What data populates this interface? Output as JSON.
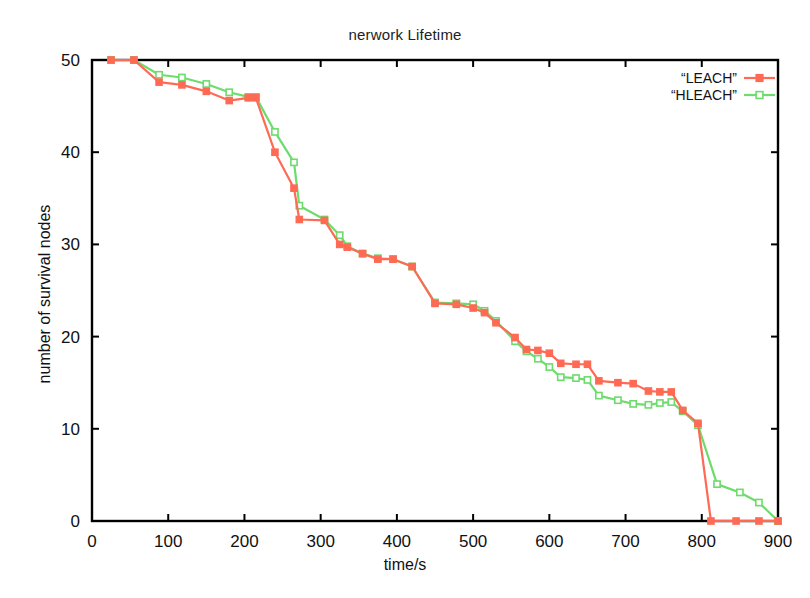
{
  "chart_data": {
    "type": "line",
    "title": "nerwork Lifetime",
    "xlabel": "time/s",
    "ylabel": "number of survival nodes",
    "xlim": [
      0,
      900
    ],
    "ylim": [
      0,
      50
    ],
    "xticks": [
      0,
      100,
      200,
      300,
      400,
      500,
      600,
      700,
      800,
      900
    ],
    "yticks": [
      0,
      10,
      20,
      30,
      40,
      50
    ],
    "grid": false,
    "legend_position": "top-right",
    "series": [
      {
        "name": "“LEACH”",
        "color": "#ff6a55",
        "marker": "filled-square",
        "points": [
          [
            25,
            50
          ],
          [
            55,
            50
          ],
          [
            88,
            47.6
          ],
          [
            118,
            47.3
          ],
          [
            150,
            46.6
          ],
          [
            180,
            45.6
          ],
          [
            205,
            45.9
          ],
          [
            215,
            45.9
          ],
          [
            240,
            40
          ],
          [
            265,
            36.1
          ],
          [
            272,
            32.7
          ],
          [
            305,
            32.6
          ],
          [
            325,
            30
          ],
          [
            335,
            29.7
          ],
          [
            355,
            29
          ],
          [
            375,
            28.4
          ],
          [
            395,
            28.4
          ],
          [
            420,
            27.6
          ],
          [
            450,
            23.6
          ],
          [
            478,
            23.5
          ],
          [
            500,
            23.1
          ],
          [
            515,
            22.6
          ],
          [
            530,
            21.5
          ],
          [
            555,
            19.9
          ],
          [
            570,
            18.6
          ],
          [
            585,
            18.5
          ],
          [
            600,
            18.2
          ],
          [
            615,
            17.1
          ],
          [
            635,
            17
          ],
          [
            650,
            17
          ],
          [
            665,
            15.2
          ],
          [
            690,
            15
          ],
          [
            710,
            14.9
          ],
          [
            730,
            14.1
          ],
          [
            745,
            14
          ],
          [
            760,
            14
          ],
          [
            775,
            12
          ],
          [
            795,
            10.6
          ],
          [
            812,
            0
          ],
          [
            845,
            0
          ],
          [
            875,
            0
          ],
          [
            900,
            0
          ]
        ]
      },
      {
        "name": "“HLEACH”",
        "color": "#6ddc6d",
        "marker": "open-square",
        "points": [
          [
            25,
            50
          ],
          [
            55,
            50
          ],
          [
            88,
            48.4
          ],
          [
            118,
            48.1
          ],
          [
            150,
            47.4
          ],
          [
            180,
            46.5
          ],
          [
            205,
            46
          ],
          [
            215,
            46
          ],
          [
            240,
            42.2
          ],
          [
            265,
            38.9
          ],
          [
            272,
            34.2
          ],
          [
            305,
            32.7
          ],
          [
            325,
            31
          ],
          [
            335,
            29.8
          ],
          [
            355,
            29
          ],
          [
            375,
            28.5
          ],
          [
            395,
            28.4
          ],
          [
            420,
            27.6
          ],
          [
            450,
            23.7
          ],
          [
            478,
            23.6
          ],
          [
            500,
            23.5
          ],
          [
            515,
            22.8
          ],
          [
            530,
            21.7
          ],
          [
            555,
            19.5
          ],
          [
            570,
            18.4
          ],
          [
            585,
            17.6
          ],
          [
            600,
            16.7
          ],
          [
            615,
            15.6
          ],
          [
            635,
            15.5
          ],
          [
            650,
            15.3
          ],
          [
            665,
            13.6
          ],
          [
            690,
            13.1
          ],
          [
            710,
            12.7
          ],
          [
            730,
            12.6
          ],
          [
            745,
            12.8
          ],
          [
            760,
            12.9
          ],
          [
            775,
            11.9
          ],
          [
            795,
            10.4
          ],
          [
            820,
            4
          ],
          [
            850,
            3.1
          ],
          [
            875,
            2
          ],
          [
            900,
            0
          ]
        ]
      }
    ]
  },
  "legend": {
    "entries": [
      {
        "label": "“LEACH”"
      },
      {
        "label": "“HLEACH”"
      }
    ]
  },
  "axis": {
    "x_tick_labels": [
      "0",
      "100",
      "200",
      "300",
      "400",
      "500",
      "600",
      "700",
      "800",
      "900"
    ],
    "y_tick_labels": [
      "0",
      "10",
      "20",
      "30",
      "40",
      "50"
    ]
  }
}
